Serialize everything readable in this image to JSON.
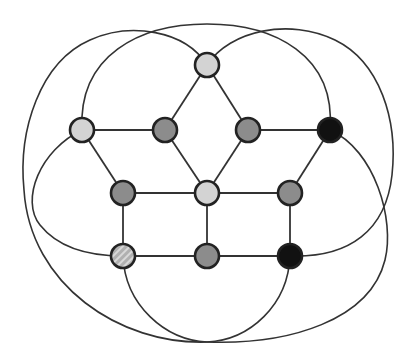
{
  "diagram": {
    "type": "graph",
    "node_radius": 12,
    "colors": {
      "light": "#d3d3d3",
      "medium": "#8c8c8c",
      "dark": "#111111",
      "hatched_bg": "#b0b0b0",
      "hatched_stripe": "#d8d8d8",
      "stroke": "#222222",
      "edge": "#333333"
    },
    "nodes": [
      {
        "id": "n1",
        "x": 207,
        "y": 65,
        "fill": "light"
      },
      {
        "id": "n2",
        "x": 82,
        "y": 130,
        "fill": "light"
      },
      {
        "id": "n3",
        "x": 165,
        "y": 130,
        "fill": "medium"
      },
      {
        "id": "n4",
        "x": 248,
        "y": 130,
        "fill": "medium"
      },
      {
        "id": "n5",
        "x": 330,
        "y": 130,
        "fill": "dark"
      },
      {
        "id": "n6",
        "x": 123,
        "y": 193,
        "fill": "medium"
      },
      {
        "id": "n7",
        "x": 207,
        "y": 193,
        "fill": "light"
      },
      {
        "id": "n8",
        "x": 290,
        "y": 193,
        "fill": "medium"
      },
      {
        "id": "n9",
        "x": 123,
        "y": 256,
        "fill": "hatched"
      },
      {
        "id": "n10",
        "x": 207,
        "y": 256,
        "fill": "medium"
      },
      {
        "id": "n11",
        "x": 290,
        "y": 256,
        "fill": "dark"
      }
    ],
    "edges": [
      [
        "n1",
        "n3"
      ],
      [
        "n1",
        "n4"
      ],
      [
        "n2",
        "n3"
      ],
      [
        "n4",
        "n5"
      ],
      [
        "n2",
        "n6"
      ],
      [
        "n3",
        "n7"
      ],
      [
        "n4",
        "n7"
      ],
      [
        "n5",
        "n8"
      ],
      [
        "n6",
        "n7"
      ],
      [
        "n7",
        "n8"
      ],
      [
        "n6",
        "n9"
      ],
      [
        "n7",
        "n10"
      ],
      [
        "n8",
        "n11"
      ],
      [
        "n9",
        "n10"
      ],
      [
        "n10",
        "n11"
      ]
    ],
    "arcs": [
      {
        "name": "arc-top-inner",
        "d": "M82,130 C78,55 140,24 207,24 C274,24 336,55 330,130"
      },
      {
        "name": "arc-top-left-outer",
        "d": "M207,65 C185,30 130,22 90,40 C40,62 18,130 24,190 C30,285 120,345 207,342"
      },
      {
        "name": "arc-top-right-outer",
        "d": "M207,65 C230,30 290,18 335,40 C380,62 398,120 392,175 C386,230 350,258 290,256"
      },
      {
        "name": "arc-left-inner",
        "d": "M82,130 C40,150 20,200 40,225 C60,250 95,256 123,256"
      },
      {
        "name": "arc-right-lower",
        "d": "M330,130 C375,150 395,220 385,260 C370,320 290,345 207,342"
      },
      {
        "name": "arc-hatched-bottom",
        "d": "M123,256 C125,305 165,340 207,342"
      },
      {
        "name": "arc-dark-bottom",
        "d": "M290,256 C288,305 250,340 207,342"
      }
    ]
  }
}
